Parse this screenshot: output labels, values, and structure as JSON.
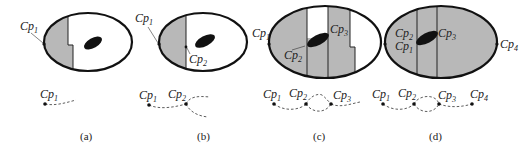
{
  "figure": {
    "colors": {
      "region_fill": "#b8b8b8",
      "outline": "#111111",
      "obstacle": "#111111",
      "background": "#ffffff"
    },
    "panels": [
      {
        "id": "a",
        "caption": "(a)",
        "ellipse_labels": [
          {
            "base": "Cp",
            "sub": "1"
          }
        ],
        "path_labels": [
          {
            "base": "Cp",
            "sub": "1"
          }
        ]
      },
      {
        "id": "b",
        "caption": "(b)",
        "ellipse_labels": [
          {
            "base": "Cp",
            "sub": "1"
          },
          {
            "base": "Cp",
            "sub": "2"
          }
        ],
        "path_labels": [
          {
            "base": "Cp",
            "sub": "1"
          },
          {
            "base": "Cp",
            "sub": "2"
          }
        ]
      },
      {
        "id": "c",
        "caption": "(c)",
        "ellipse_labels": [
          {
            "base": "Cp",
            "sub": "1"
          },
          {
            "base": "Cp",
            "sub": "2"
          },
          {
            "base": "Cp",
            "sub": "3"
          }
        ],
        "path_labels": [
          {
            "base": "Cp",
            "sub": "1"
          },
          {
            "base": "Cp",
            "sub": "2"
          },
          {
            "base": "Cp",
            "sub": "3"
          }
        ]
      },
      {
        "id": "d",
        "caption": "(d)",
        "ellipse_labels": [
          {
            "base": "Cp",
            "sub": "2"
          },
          {
            "base": "Cp",
            "sub": "1"
          },
          {
            "base": "Cp",
            "sub": "3"
          },
          {
            "base": "Cp",
            "sub": "4"
          }
        ],
        "path_labels": [
          {
            "base": "Cp",
            "sub": "1"
          },
          {
            "base": "Cp",
            "sub": "2"
          },
          {
            "base": "Cp",
            "sub": "3"
          },
          {
            "base": "Cp",
            "sub": "4"
          }
        ]
      }
    ]
  }
}
